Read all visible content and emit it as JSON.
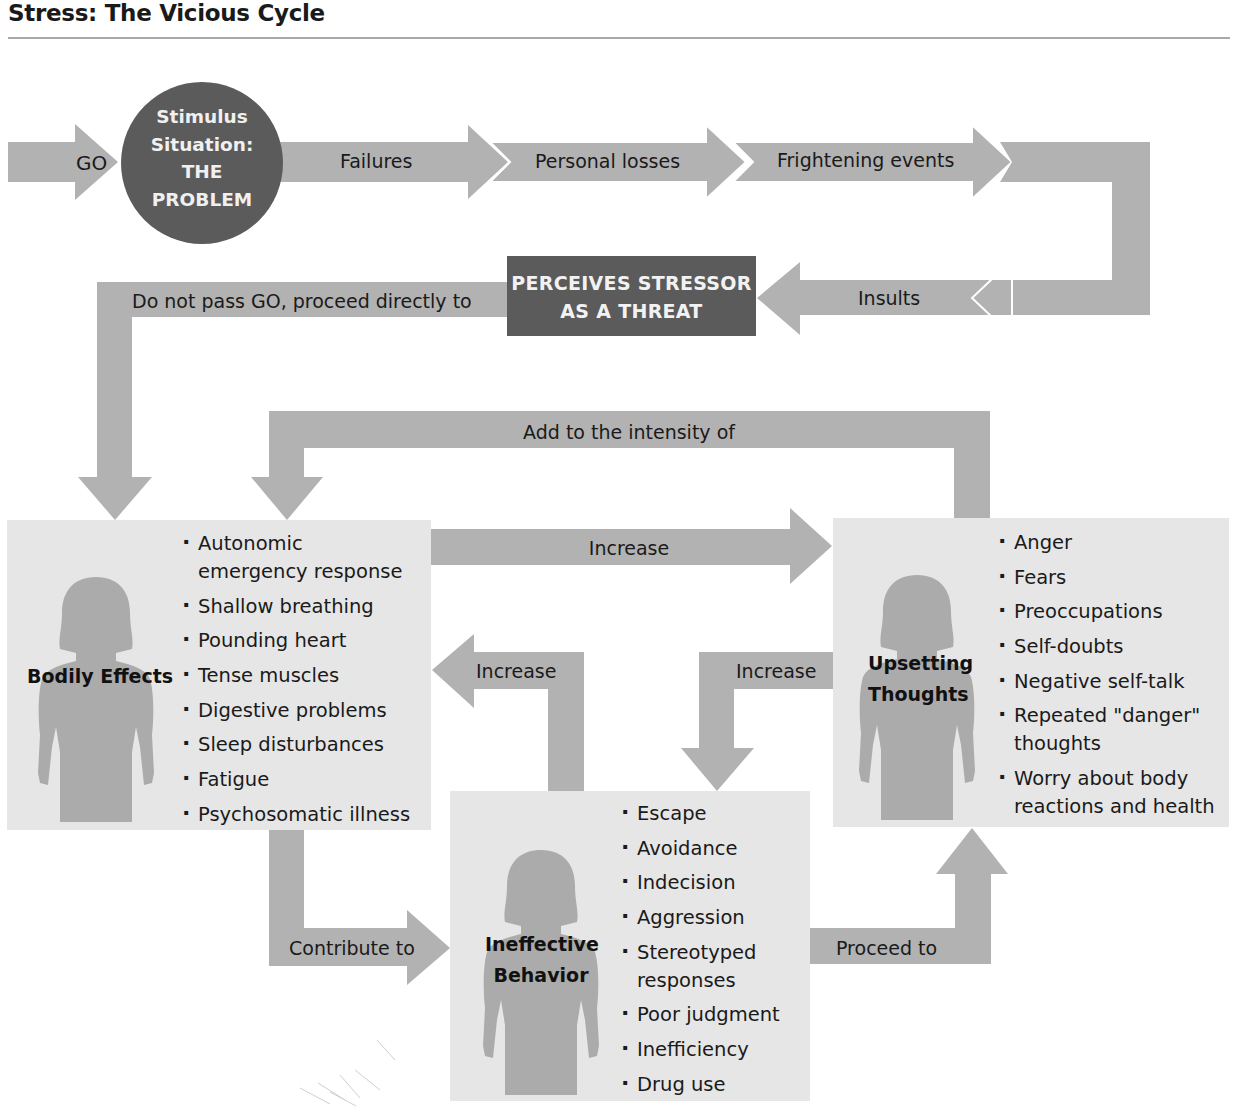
{
  "title": "Stress: The Vicious Cycle",
  "colors": {
    "arrow": "#b2b2b2",
    "dark_node": "#5b5b5b",
    "panel": "#e6e6e6",
    "silhouette": "#ababab",
    "text": "#1a1a1a"
  },
  "start": {
    "go_label": "GO",
    "stimulus_lines": [
      "Stimulus",
      "Situation:",
      "THE",
      "PROBLEM"
    ]
  },
  "top_flow": {
    "labels": [
      "Failures",
      "Personal losses",
      "Frightening events"
    ],
    "return_label": "Insults"
  },
  "threat_node": {
    "lines": [
      "PERCEIVES STRESSOR",
      "AS A THREAT"
    ]
  },
  "connectors": {
    "do_not_pass_go": "Do not pass GO, proceed directly to",
    "add_intensity": "Add to the intensity of",
    "bodily_to_thoughts": "Increase",
    "behavior_to_bodily": "Increase",
    "thoughts_to_behavior": "Increase",
    "bodily_to_behavior": "Contribute to",
    "behavior_to_thoughts": "Proceed to"
  },
  "panels": {
    "bodily": {
      "title": "Bodily Effects",
      "items": [
        [
          "Autonomic",
          "emergency response"
        ],
        [
          "Shallow breathing"
        ],
        [
          "Pounding heart"
        ],
        [
          "Tense muscles"
        ],
        [
          "Digestive problems"
        ],
        [
          "Sleep disturbances"
        ],
        [
          "Fatigue"
        ],
        [
          "Psychosomatic illness"
        ]
      ]
    },
    "thoughts": {
      "title_lines": [
        "Upsetting",
        "Thoughts"
      ],
      "items": [
        [
          "Anger"
        ],
        [
          "Fears"
        ],
        [
          "Preoccupations"
        ],
        [
          "Self-doubts"
        ],
        [
          "Negative self-talk"
        ],
        [
          "Repeated \"danger\"",
          "thoughts"
        ],
        [
          "Worry about body",
          "reactions and health"
        ]
      ]
    },
    "behavior": {
      "title_lines": [
        "Ineffective",
        "Behavior"
      ],
      "items": [
        [
          "Escape"
        ],
        [
          "Avoidance"
        ],
        [
          "Indecision"
        ],
        [
          "Aggression"
        ],
        [
          "Stereotyped",
          "responses"
        ],
        [
          "Poor judgment"
        ],
        [
          "Inefficiency"
        ],
        [
          "Drug use"
        ]
      ]
    }
  }
}
